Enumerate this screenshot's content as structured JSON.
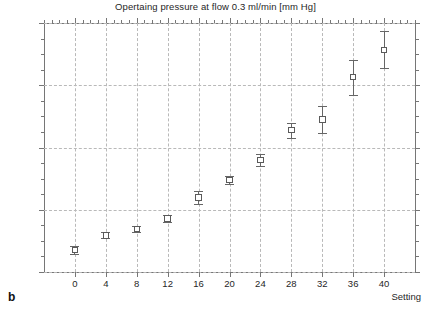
{
  "figure": {
    "panel_label": "b",
    "axis_caption": "Setting"
  },
  "chart_data": {
    "type": "scatter",
    "title": "Opertaing pressure at flow 0.3 ml/min [mm Hg]",
    "xlabel": "Setting",
    "ylabel": "",
    "xlim": [
      -4,
      44
    ],
    "ylim": [
      0,
      40
    ],
    "grid": true,
    "legend": "none",
    "marker": "open-square",
    "error_bars": "vertical",
    "x_ticks": [
      0,
      4,
      8,
      12,
      16,
      20,
      24,
      28,
      32,
      36,
      40
    ],
    "x_tick_labels": [
      "0",
      "4",
      "8",
      "12",
      "16",
      "20",
      "24",
      "28",
      "32",
      "36",
      "40"
    ],
    "y_ticks": [
      0,
      10,
      20,
      30,
      40
    ],
    "y_tick_labels": [
      "0",
      "10",
      "20",
      "30",
      "40"
    ],
    "y_minor_tick_step": 2.5,
    "x_minor_tick_step": 1,
    "x": [
      0,
      4,
      8,
      12,
      16,
      20,
      24,
      28,
      32,
      36,
      40
    ],
    "values": [
      3.5,
      5.9,
      6.9,
      8.6,
      12.0,
      14.8,
      18.0,
      22.8,
      24.5,
      31.3,
      35.7
    ],
    "errors": [
      0.6,
      0.5,
      0.5,
      0.5,
      1.0,
      0.7,
      1.0,
      1.2,
      2.2,
      2.8,
      3.0
    ],
    "points": [
      {
        "x": 0,
        "y": 3.5,
        "err": 0.6
      },
      {
        "x": 4,
        "y": 5.9,
        "err": 0.5
      },
      {
        "x": 8,
        "y": 6.9,
        "err": 0.5
      },
      {
        "x": 12,
        "y": 8.6,
        "err": 0.5
      },
      {
        "x": 16,
        "y": 12.0,
        "err": 1.0
      },
      {
        "x": 20,
        "y": 14.8,
        "err": 0.7
      },
      {
        "x": 24,
        "y": 18.0,
        "err": 1.0
      },
      {
        "x": 28,
        "y": 22.8,
        "err": 1.2
      },
      {
        "x": 32,
        "y": 24.5,
        "err": 2.2
      },
      {
        "x": 36,
        "y": 31.3,
        "err": 2.8
      },
      {
        "x": 40,
        "y": 35.7,
        "err": 3.0
      }
    ]
  },
  "colors": {
    "axis": "#767676",
    "grid": "#b9b9b9",
    "marker": "#5a5a5a",
    "error_bar": "#666666",
    "text": "#1f1f1f",
    "background": "#ffffff"
  }
}
